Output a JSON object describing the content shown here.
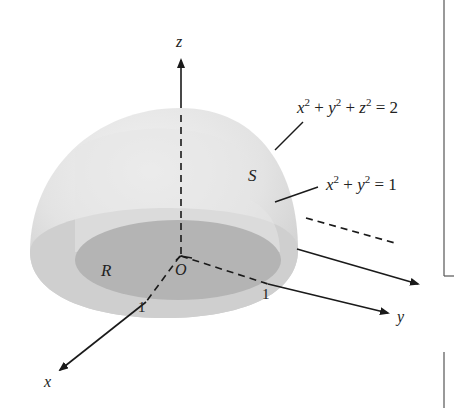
{
  "figure": {
    "axes": {
      "x_label": "x",
      "y_label": "y",
      "z_label": "z",
      "origin_label": "O"
    },
    "regions": {
      "surface_label": "S",
      "base_region_label": "R"
    },
    "tick_labels": {
      "x_tick": "1",
      "y_tick": "1"
    },
    "equations": {
      "sphere": {
        "x": "x",
        "x_exp": "2",
        "plus1": " + ",
        "y": "y",
        "y_exp": "2",
        "plus2": " + ",
        "z": "z",
        "z_exp": "2",
        "rhs": " = 2"
      },
      "cylinder": {
        "x": "x",
        "x_exp": "2",
        "plus1": " + ",
        "y": "y",
        "y_exp": "2",
        "rhs": " = 1"
      }
    },
    "colors": {
      "outer_shell": "#d9d9d9",
      "inner_region": "#b4b4b4",
      "dome_highlight": "#ececec",
      "line": "#1a1a1a",
      "frame": "#555555"
    }
  }
}
